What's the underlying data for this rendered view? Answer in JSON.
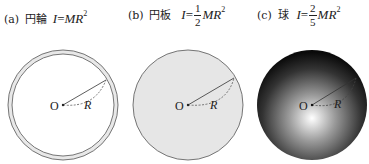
{
  "figures": [
    {
      "tag": "(a)",
      "name": "円輪",
      "formula": {
        "lhs": "I",
        "eq": "=",
        "coef_num": "",
        "coef_den": "",
        "rhs": "MR",
        "exp": "2"
      },
      "shape": "ring",
      "center_label": "O",
      "radius_label": "R"
    },
    {
      "tag": "(b)",
      "name": "円板",
      "formula": {
        "lhs": "I",
        "eq": "=",
        "coef_num": "1",
        "coef_den": "2",
        "rhs": "MR",
        "exp": "2"
      },
      "shape": "disk",
      "center_label": "O",
      "radius_label": "R"
    },
    {
      "tag": "(c)",
      "name": "球",
      "formula": {
        "lhs": "I",
        "eq": "=",
        "coef_num": "2",
        "coef_den": "5",
        "rhs": "MR",
        "exp": "2"
      },
      "shape": "sphere",
      "center_label": "O",
      "radius_label": "R"
    }
  ],
  "colors": {
    "stroke": "#555555",
    "disk_fill": "#e6e6e6",
    "sphere_center": "#ffffff",
    "sphere_edge": "#111111"
  }
}
